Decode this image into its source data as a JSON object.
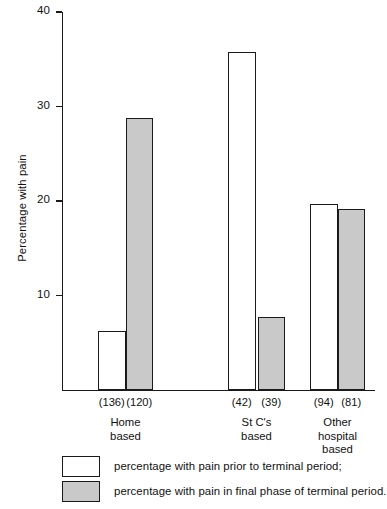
{
  "chart_data": {
    "type": "bar",
    "title": "",
    "xlabel": "",
    "ylabel": "Percentage with pain",
    "ylim": [
      0,
      40
    ],
    "yticks": [
      10,
      20,
      30,
      40
    ],
    "ytick_labels": [
      "10",
      "20",
      "30",
      "40"
    ],
    "grid": false,
    "legend_position": "bottom-left",
    "categories": [
      "Home\nbased",
      "St C's\nbased",
      "Other\nhospital\nbased"
    ],
    "category_labels": [
      "Home based",
      "St C's based",
      "Other hospital based"
    ],
    "series": [
      {
        "name": "percentage with pain prior to terminal period;",
        "short_name": "prior",
        "color": "#ffffff",
        "values": [
          6.2,
          35.8,
          19.7
        ],
        "counts": [
          "(136)",
          "(42)",
          "(94)"
        ]
      },
      {
        "name": "percentage with pain in final phase of terminal period.",
        "short_name": "final phase",
        "color": "#c9c9c9",
        "values": [
          28.8,
          7.7,
          19.2
        ],
        "counts": [
          "(120)",
          "(39)",
          "(81)"
        ]
      }
    ],
    "annotations": {
      "counts_row": [
        "(136)",
        "(120)",
        "(42)",
        "(39)",
        "(94)",
        "(81)"
      ]
    }
  },
  "legend": {
    "items": [
      {
        "label": "percentage with pain prior to terminal period;",
        "swatch": "white"
      },
      {
        "label": "percentage with pain in final phase of terminal period.",
        "swatch": "grey"
      }
    ]
  },
  "colors": {
    "axis": "#1a1a1a",
    "bar_outline": "#1b1b1b",
    "bar_fill_white": "#ffffff",
    "bar_fill_grey": "#c9c9c9",
    "background": "#ffffff"
  }
}
